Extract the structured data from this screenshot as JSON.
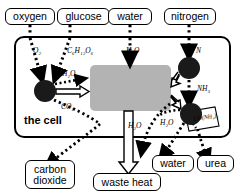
{
  "diagram": {
    "title_in_figure": "the cell",
    "cell_label": "the cell",
    "type": "cell-metabolism-flow-diagram"
  },
  "inputs": [
    {
      "id": "oxygen",
      "label": "oxygen",
      "formula_text": "O2",
      "formula_base": "O",
      "formula_sub": "2"
    },
    {
      "id": "glucose",
      "label": "glucose",
      "formula_text": "C6H12O6",
      "formula_base": "C",
      "formula_sub": "6"
    },
    {
      "id": "water",
      "label": "water",
      "formula_text": "H2O",
      "formula_base": "H",
      "formula_sub": "2"
    },
    {
      "id": "nitrogen",
      "label": "nitrogen",
      "formula_text": "N",
      "formula_base": "N",
      "formula_sub": ""
    }
  ],
  "outputs": [
    {
      "id": "carbon-dioxide",
      "line1": "carbon",
      "line2": "dioxide"
    },
    {
      "id": "waste-heat",
      "line1": "waste heat",
      "line2": ""
    },
    {
      "id": "water-out",
      "line1": "water",
      "line2": ""
    },
    {
      "id": "urea",
      "line1": "urea",
      "line2": ""
    }
  ],
  "formulas": {
    "oxygen_in": {
      "parts": [
        {
          "t": "O",
          "sub": "2"
        }
      ]
    },
    "glucose_in": {
      "parts": [
        {
          "t": "C",
          "sub": "6"
        },
        {
          "t": "H",
          "sub": "12"
        },
        {
          "t": "O",
          "sub": "6"
        }
      ]
    },
    "water_in": {
      "parts": [
        {
          "t": "H",
          "sub": "2"
        },
        {
          "t": "O",
          "sub": ""
        }
      ]
    },
    "water_cell": {
      "parts": [
        {
          "t": "H",
          "sub": "2"
        },
        {
          "t": "O",
          "sub": ""
        }
      ]
    },
    "co2": {
      "parts": [
        {
          "t": "CO",
          "sub": "2"
        }
      ]
    },
    "nitrogen_in": {
      "parts": [
        {
          "t": "N",
          "sub": ""
        }
      ]
    },
    "ammonia": {
      "parts": [
        {
          "t": "NH",
          "sub": "3"
        }
      ]
    },
    "water_mid": {
      "parts": [
        {
          "t": "H",
          "sub": "2"
        },
        {
          "t": "O",
          "sub": ""
        }
      ]
    },
    "water_right": {
      "parts": [
        {
          "t": "H",
          "sub": "2"
        },
        {
          "t": "O",
          "sub": ""
        }
      ]
    },
    "urea_formula": {
      "parts": [
        {
          "t": "CO(NH",
          "sub": "2"
        },
        {
          "t": ")",
          "sub": "2"
        }
      ]
    }
  },
  "formula_plain": {
    "oxygen_in": "O₂",
    "glucose_in": "C₆H₁₂O₆",
    "water_in": "H₂O",
    "water_cell": "H₂O",
    "co2": "CO₂",
    "nitrogen_in": "N",
    "ammonia": "NH₃",
    "water_mid": "H₂O",
    "water_right": "H₂O",
    "urea_formula": "CO(NH₂)₂"
  },
  "colors": {
    "node_fill": "#1a1a1a",
    "metabolism_box": "#b3b3b3",
    "outline": "#000000",
    "background": "#ffffff"
  },
  "nodes": [
    {
      "id": "respiration-node",
      "cx": 45,
      "cy": 91,
      "r": 11
    },
    {
      "id": "nitrogen-node",
      "cx": 189,
      "cy": 68,
      "r": 11
    },
    {
      "id": "urea-node",
      "cx": 191,
      "cy": 114,
      "r": 11
    }
  ],
  "metabolism_box": {
    "x": 90,
    "y": 65,
    "w": 81,
    "h": 46,
    "label": ""
  }
}
